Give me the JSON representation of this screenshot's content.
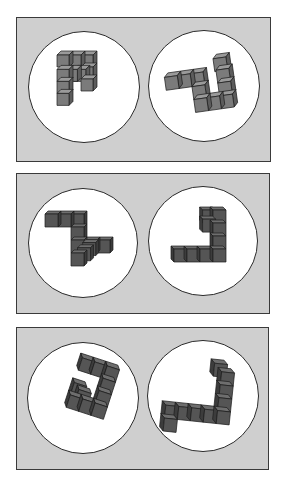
{
  "figure": {
    "type": "mental-rotation-stimuli",
    "colors": {
      "background": "#ffffff",
      "panel_fill": "#cfcfcf",
      "panel_border": "#3a3a3a",
      "circle_fill": "#ffffff",
      "circle_border": "#2a2a2a",
      "light_cube": {
        "front": "#7b7b7b",
        "top": "#9a9a9a",
        "side": "#5c5c5c"
      },
      "dark_cube": {
        "front": "#555555",
        "top": "#6e6e6e",
        "side": "#3c3c3c"
      }
    },
    "panels": [
      {
        "id": "pair-1",
        "box": {
          "x": 16,
          "y": 17,
          "w": 255,
          "h": 145
        },
        "shade": "light_cube",
        "items": [
          {
            "circle": {
              "cx": 84,
              "cy": 87,
              "r": 56
            },
            "cube": {
              "size": 12,
              "dx": 4,
              "dy": -4
            },
            "origin": {
              "x": 57,
              "y": 55
            },
            "cells": [
              [
                0,
                0
              ],
              [
                1,
                0
              ],
              [
                2,
                0
              ],
              [
                2,
                1
              ],
              [
                2,
                2
              ],
              [
                0,
                1.2
              ],
              [
                0,
                2.2
              ],
              [
                0,
                3.2
              ],
              [
                0.7,
                1.2
              ],
              [
                1.4,
                1.2
              ]
            ]
          },
          {
            "circle": {
              "cx": 204,
              "cy": 86,
              "r": 56
            },
            "cube": {
              "size": 13,
              "dx": 4,
              "dy": -4,
              "rotate": -8
            },
            "origin": {
              "x": 166,
              "y": 72
            },
            "cells": [
              [
                0,
                0
              ],
              [
                1,
                0
              ],
              [
                2,
                0
              ],
              [
                2,
                1
              ],
              [
                2,
                2
              ],
              [
                3,
                2
              ],
              [
                4,
                2
              ],
              [
                4,
                1
              ],
              [
                4,
                0
              ],
              [
                3.9,
                -0.9
              ]
            ]
          }
        ]
      },
      {
        "id": "pair-2",
        "box": {
          "x": 16,
          "y": 173,
          "w": 254,
          "h": 141
        },
        "shade": "dark_cube",
        "items": [
          {
            "circle": {
              "cx": 83,
              "cy": 243,
              "r": 55
            },
            "cube": {
              "size": 13,
              "dx": 3,
              "dy": -3
            },
            "origin": {
              "x": 45,
              "y": 214
            },
            "cells": [
              [
                0,
                0
              ],
              [
                1,
                0
              ],
              [
                2,
                0
              ],
              [
                2,
                1
              ],
              [
                2,
                2
              ],
              [
                2,
                3
              ],
              [
                3,
                2
              ],
              [
                4,
                2
              ],
              [
                2.5,
                2.6
              ],
              [
                2.9,
                2.2
              ]
            ]
          },
          {
            "circle": {
              "cx": 203,
              "cy": 241,
              "r": 55
            },
            "cube": {
              "size": 13,
              "dx": -3,
              "dy": -3
            },
            "origin": {
              "x": 174,
              "y": 249
            },
            "cells": [
              [
                0,
                0
              ],
              [
                1,
                0
              ],
              [
                2,
                0
              ],
              [
                3,
                0
              ],
              [
                3,
                -1
              ],
              [
                3,
                -2
              ],
              [
                3,
                -3
              ],
              [
                2.2,
                -3
              ],
              [
                2.2,
                -2.3
              ]
            ]
          }
        ]
      },
      {
        "id": "pair-3",
        "box": {
          "x": 16,
          "y": 327,
          "w": 253,
          "h": 143
        },
        "shade": "dark_cube",
        "items": [
          {
            "circle": {
              "cx": 83,
              "cy": 398,
              "r": 56
            },
            "cube": {
              "size": 13,
              "dx": -3,
              "dy": -4,
              "rotate": 18
            },
            "origin": {
              "x": 70,
              "y": 360
            },
            "cells": [
              [
                0,
                0
              ],
              [
                1,
                0
              ],
              [
                2,
                0
              ],
              [
                2,
                1
              ],
              [
                2,
                2
              ],
              [
                2,
                3
              ],
              [
                1,
                3
              ],
              [
                0,
                3
              ],
              [
                0,
                2
              ],
              [
                0.5,
                2.4
              ]
            ]
          },
          {
            "circle": {
              "cx": 203,
              "cy": 396,
              "r": 56
            },
            "cube": {
              "size": 13,
              "dx": -4,
              "dy": -4,
              "rotate": 6
            },
            "origin": {
              "x": 167,
              "y": 409
            },
            "cells": [
              [
                0,
                0
              ],
              [
                0,
                1
              ],
              [
                1,
                0
              ],
              [
                2,
                0
              ],
              [
                3,
                0
              ],
              [
                4,
                0
              ],
              [
                4,
                -1
              ],
              [
                4,
                -2
              ],
              [
                4,
                -3
              ],
              [
                3.4,
                -3.6
              ]
            ]
          }
        ]
      }
    ]
  }
}
